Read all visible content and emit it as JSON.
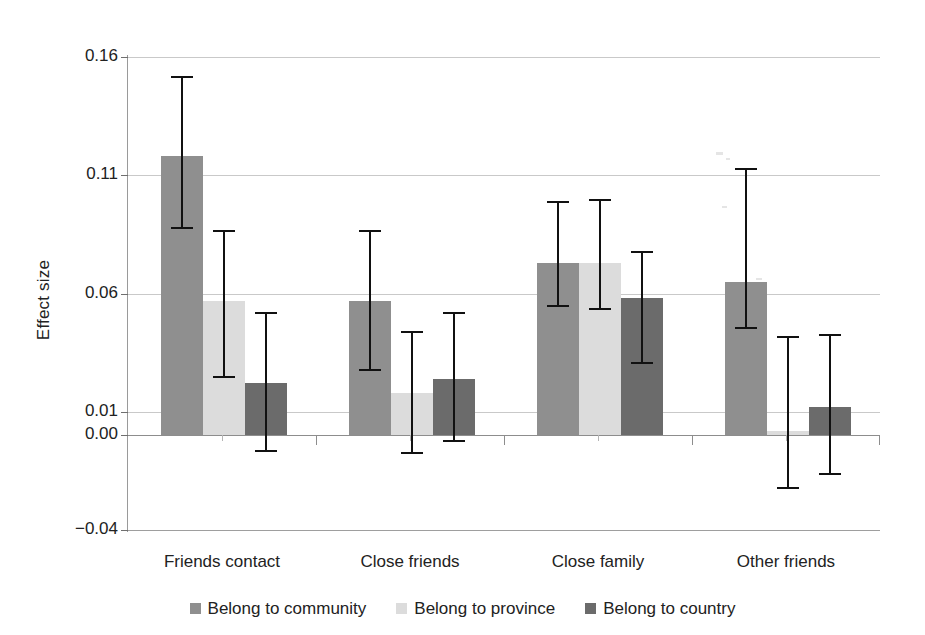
{
  "chart_data": {
    "type": "bar",
    "title": "",
    "subtitle": "",
    "xlabel": "",
    "ylabel": "Effect size",
    "ylim": [
      -0.04,
      0.16
    ],
    "yticks": [
      0.16,
      0.11,
      0.06,
      0.01,
      0.0,
      -0.04
    ],
    "ytick_labels": [
      "0.16",
      "0.11",
      "0.06",
      "0.01",
      "0.00",
      "−0.04"
    ],
    "grid": true,
    "legend_position": "bottom",
    "error_bars": true,
    "categories": [
      "Friends contact",
      "Close friends",
      "Close family",
      "Other friends"
    ],
    "series": [
      {
        "name": "Belong to community",
        "color": "#8f8f8f",
        "values": [
          0.118,
          0.057,
          0.073,
          0.065
        ],
        "err_low": [
          0.088,
          0.028,
          0.055,
          0.046
        ],
        "err_high": [
          0.152,
          0.087,
          0.099,
          0.113
        ]
      },
      {
        "name": "Belong to province",
        "color": "#dcdcdc",
        "values": [
          0.057,
          0.018,
          0.073,
          0.002
        ],
        "err_low": [
          0.025,
          -0.007,
          0.054,
          -0.022
        ],
        "err_high": [
          0.087,
          0.044,
          0.1,
          0.042
        ]
      },
      {
        "name": "Belong to country",
        "color": "#6b6b6b",
        "values": [
          0.022,
          0.024,
          0.058,
          0.012
        ],
        "err_low": [
          -0.006,
          -0.002,
          0.031,
          -0.016
        ],
        "err_high": [
          0.052,
          0.052,
          0.078,
          0.043
        ]
      }
    ]
  },
  "axis": {
    "y_title": "Effect size",
    "tick_0": "0.16",
    "tick_1": "0.11",
    "tick_2": "0.06",
    "tick_3": "0.01",
    "tick_4": "0.00",
    "tick_5": "−0.04"
  },
  "categories": {
    "c0": "Friends contact",
    "c1": "Close friends",
    "c2": "Close family",
    "c3": "Other friends"
  },
  "legend": {
    "s0": "Belong to community",
    "s1": "Belong to province",
    "s2": "Belong to country"
  },
  "colors": {
    "series_1": "#8f8f8f",
    "series_2": "#dcdcdc",
    "series_3": "#6b6b6b",
    "grid": "#c9c9c9",
    "axis": "#8d8d8d",
    "error_bar": "#111111",
    "background": "#ffffff"
  }
}
